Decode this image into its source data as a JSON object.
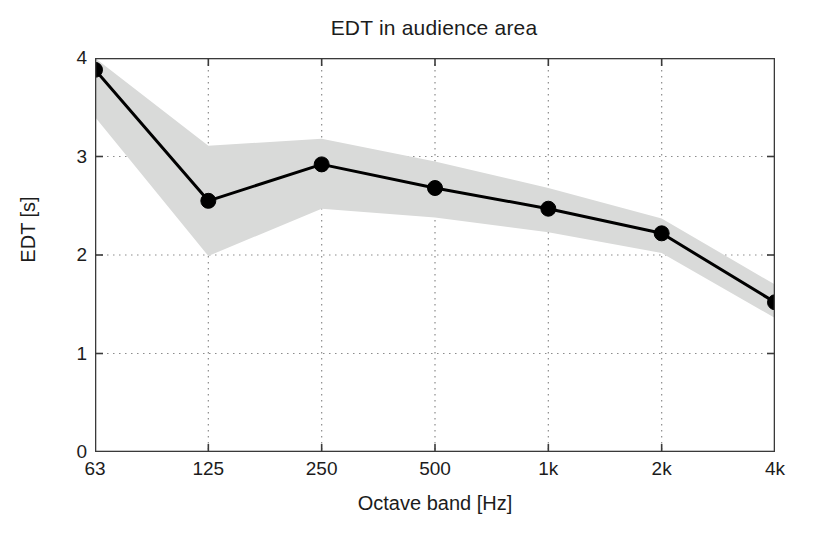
{
  "chart_data": {
    "type": "line",
    "title": "EDT in audience area",
    "xlabel": "Octave band [Hz]",
    "ylabel": "EDT [s]",
    "categories": [
      "63",
      "125",
      "250",
      "500",
      "1k",
      "2k",
      "4k"
    ],
    "x_tick_labels": [
      "63",
      "125",
      "250",
      "500",
      "1k",
      "2k",
      "4k"
    ],
    "y_tick_labels": [
      "0",
      "1",
      "2",
      "3",
      "4"
    ],
    "y_ticks": [
      0,
      1,
      2,
      3,
      4
    ],
    "ylim": [
      0,
      4
    ],
    "xlim": [
      0,
      6
    ],
    "grid": true,
    "grid_style": "dotted",
    "legend": null,
    "series": [
      {
        "name": "EDT mean",
        "values": [
          3.88,
          2.55,
          2.92,
          2.68,
          2.47,
          2.22,
          1.52
        ],
        "marker": "filled-circle",
        "color": "#000000",
        "line_width": 3
      }
    ],
    "band": {
      "name": "EDT spread",
      "upper": [
        4.0,
        3.11,
        3.18,
        2.95,
        2.68,
        2.37,
        1.7
      ],
      "lower": [
        3.4,
        1.99,
        2.47,
        2.38,
        2.23,
        2.02,
        1.36
      ],
      "fill_color": "#d9dad9"
    },
    "axis_color": "#3a3a3a",
    "background": "#ffffff"
  }
}
